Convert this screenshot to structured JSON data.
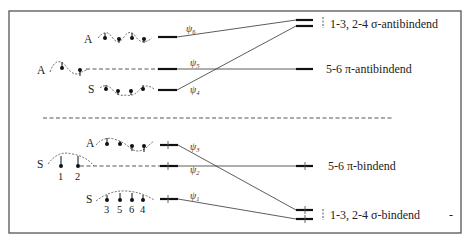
{
  "diagram": {
    "title": "",
    "separator": "dashed",
    "antibonding": {
      "orbitals": [
        {
          "id": "psi6",
          "symbol": "ψ",
          "sub": "6",
          "symmetry": "A",
          "occupied": false
        },
        {
          "id": "psi5",
          "symbol": "ψ",
          "sub": "5",
          "symmetry": "A",
          "occupied": false
        },
        {
          "id": "psi4",
          "symbol": "ψ",
          "sub": "4",
          "symmetry": "S",
          "occupied": false
        }
      ],
      "right_labels": {
        "sigma": "1-3, 2-4 σ-antibindend",
        "pi": "5-6 π-antibindend"
      }
    },
    "bonding": {
      "orbitals": [
        {
          "id": "psi3",
          "symbol": "ψ",
          "sub": "3",
          "symmetry": "A",
          "occupied": true
        },
        {
          "id": "psi2",
          "symbol": "ψ",
          "sub": "2",
          "symmetry": "S",
          "occupied": true
        },
        {
          "id": "psi1",
          "symbol": "ψ",
          "sub": "1",
          "symmetry": "S",
          "occupied": true
        }
      ],
      "right_labels": {
        "pi": "5-6 π-bindend",
        "sigma": "1-3, 2-4 σ-bindend"
      },
      "atom_labels_psi2": [
        "1",
        "2"
      ],
      "atom_labels_psi1": [
        "3",
        "5",
        "6",
        "4"
      ]
    },
    "stray_mark": "-"
  }
}
